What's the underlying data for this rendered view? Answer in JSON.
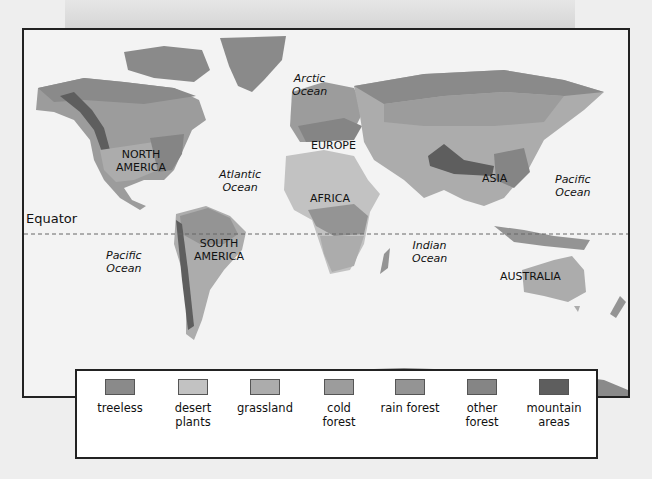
{
  "map": {
    "continents": [
      {
        "name": "NORTH AMERICA",
        "lines": [
          "NORTH",
          "AMERICA"
        ],
        "x": 92,
        "y": 118
      },
      {
        "name": "SOUTH AMERICA",
        "lines": [
          "SOUTH",
          "AMERICA"
        ],
        "x": 172,
        "y": 205
      },
      {
        "name": "EUROPE",
        "lines": [
          "EUROPE"
        ],
        "x": 287,
        "y": 108
      },
      {
        "name": "AFRICA",
        "lines": [
          "AFRICA"
        ],
        "x": 286,
        "y": 161
      },
      {
        "name": "ASIA",
        "lines": [
          "ASIA"
        ],
        "x": 458,
        "y": 142
      },
      {
        "name": "AUSTRALIA",
        "lines": [
          "AUSTRALIA"
        ],
        "x": 477,
        "y": 240
      }
    ],
    "oceans": [
      {
        "name": "Arctic Ocean",
        "lines": [
          "Arctic",
          "Ocean"
        ],
        "x": 266,
        "y": 43
      },
      {
        "name": "Atlantic Ocean",
        "lines": [
          "Atlantic",
          "Ocean"
        ],
        "x": 195,
        "y": 138
      },
      {
        "name": "Pacific Ocean (east)",
        "lines": [
          "Pacific",
          "Ocean"
        ],
        "x": 81,
        "y": 219
      },
      {
        "name": "Pacific Ocean (west)",
        "lines": [
          "Pacific",
          "Ocean"
        ],
        "x": 528,
        "y": 143
      },
      {
        "name": "Indian Ocean",
        "lines": [
          "Indian",
          "Ocean"
        ],
        "x": 386,
        "y": 209
      }
    ],
    "equator_label": "Equator"
  },
  "legend": {
    "items": [
      {
        "label_line1": "treeless",
        "label_line2": "",
        "color": "#8a8a8a"
      },
      {
        "label_line1": "desert",
        "label_line2": "plants",
        "color": "#c2c2c2"
      },
      {
        "label_line1": "grassland",
        "label_line2": "",
        "color": "#acacac"
      },
      {
        "label_line1": "cold",
        "label_line2": "forest",
        "color": "#9c9c9c"
      },
      {
        "label_line1": "rain forest",
        "label_line2": "",
        "color": "#949494"
      },
      {
        "label_line1": "other",
        "label_line2": "forest",
        "color": "#858585"
      },
      {
        "label_line1": "mountain",
        "label_line2": "areas",
        "color": "#5e5e5e"
      }
    ]
  }
}
